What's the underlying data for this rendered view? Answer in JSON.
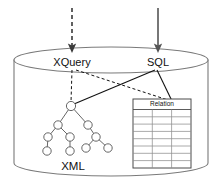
{
  "diagram": {
    "type": "architecture-diagram",
    "canvas": {
      "width": 222,
      "height": 194
    },
    "container": {
      "name": "database-cylinder",
      "shape": "cylinder",
      "stroke_color": "#7a7a7a",
      "fill_color": "#ffffff",
      "left": 14,
      "right": 208,
      "top": 47,
      "bottom": 176,
      "ellipse_ry": 13
    },
    "entry_points": [
      {
        "id": "xquery",
        "label": "XQuery",
        "x": 72,
        "y": 62,
        "arrow_style": "dashed",
        "arrow_color": "#3a3a3a",
        "arrow_from_y": 8,
        "arrow_to_y": 50
      },
      {
        "id": "sql",
        "label": "SQL",
        "x": 158,
        "y": 62,
        "arrow_style": "solid",
        "arrow_color": "#555555",
        "arrow_from_y": 8,
        "arrow_to_y": 50
      }
    ],
    "connectors": [
      {
        "id": "xquery-to-xml",
        "from": "xquery",
        "to": "xml-tree-root",
        "style": "dashed"
      },
      {
        "id": "xquery-to-relation",
        "from": "xquery",
        "to": "relation-table",
        "style": "dashed"
      },
      {
        "id": "sql-to-xml",
        "from": "sql",
        "to": "xml-tree-root",
        "style": "solid"
      },
      {
        "id": "sql-to-relation",
        "from": "sql",
        "to": "relation-table",
        "style": "solid"
      }
    ],
    "xml_tree": {
      "label": "XML",
      "label_x": 73,
      "label_y": 166,
      "node_radius": 4.2,
      "node_fill": "#ffffff",
      "node_stroke": "#555555",
      "nodes": [
        {
          "id": "n0",
          "x": 71,
          "y": 106
        },
        {
          "id": "n1",
          "x": 58,
          "y": 125
        },
        {
          "id": "n2",
          "x": 88,
          "y": 125
        },
        {
          "id": "n3",
          "x": 48,
          "y": 137
        },
        {
          "id": "n4",
          "x": 70,
          "y": 137
        },
        {
          "id": "n5",
          "x": 96,
          "y": 137
        },
        {
          "id": "n6",
          "x": 47,
          "y": 151
        },
        {
          "id": "n7",
          "x": 70,
          "y": 151
        },
        {
          "id": "n8",
          "x": 86,
          "y": 148
        },
        {
          "id": "n9",
          "x": 108,
          "y": 148
        }
      ],
      "edges": [
        [
          "n0",
          "n1"
        ],
        [
          "n0",
          "n2"
        ],
        [
          "n1",
          "n3"
        ],
        [
          "n1",
          "n4"
        ],
        [
          "n2",
          "n5"
        ],
        [
          "n3",
          "n6"
        ],
        [
          "n4",
          "n7"
        ],
        [
          "n5",
          "n8"
        ],
        [
          "n5",
          "n9"
        ]
      ]
    },
    "relation_table": {
      "header": "Relation",
      "x": 133,
      "y": 99,
      "width": 58,
      "height": 69,
      "header_height": 10,
      "columns": 3,
      "body_rows": 8,
      "border_color": "#4a4a4a",
      "grid_color": "#8e8e8e",
      "fill_color": "#ffffff"
    }
  }
}
